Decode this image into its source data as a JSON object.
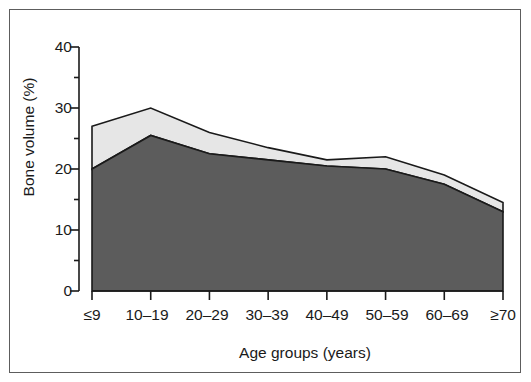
{
  "chart_data": {
    "type": "area",
    "title": "",
    "subtitle": "",
    "xlabel": "Age groups (years)",
    "ylabel": "Bone volume (%)",
    "categories": [
      "≤9",
      "10–19",
      "20–29",
      "30–39",
      "40–49",
      "50–59",
      "60–69",
      "≥70"
    ],
    "xtick_labels": [
      "≤9",
      "10–19",
      "20–29",
      "30–39",
      "40–49",
      "50–59",
      "60–69",
      "≥70"
    ],
    "ytick_labels": [
      "0",
      "10",
      "20",
      "30",
      "40"
    ],
    "ytick_values": [
      0,
      10,
      20,
      30,
      40
    ],
    "ylim": [
      0,
      40
    ],
    "grid": false,
    "legend": false,
    "legend_position": "none",
    "stacked": true,
    "series": [
      {
        "name": "Mineralised bone volume",
        "color": "#5c5c5c",
        "values": [
          20.0,
          25.5,
          22.5,
          21.5,
          20.5,
          20.0,
          17.5,
          13.0
        ]
      },
      {
        "name": "Osteoid (upper band to total)",
        "color": "#e6e6e6",
        "values": [
          7.0,
          4.5,
          3.5,
          2.0,
          1.0,
          2.0,
          1.5,
          1.5
        ]
      }
    ],
    "cumulative_totals": [
      27.0,
      30.0,
      26.0,
      23.5,
      21.5,
      22.0,
      19.0,
      14.5
    ],
    "colors": {
      "lower_band": "#5c5c5c",
      "upper_band": "#e6e6e6",
      "outline": "#1a1a1a",
      "axis": "#1a1a1a",
      "frame": "#5d5d5d",
      "background": "#ffffff"
    }
  }
}
